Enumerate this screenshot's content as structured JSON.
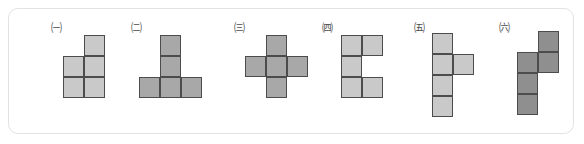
{
  "canvas": {
    "width": 584,
    "height": 144,
    "background": "#ffffff"
  },
  "panel": {
    "border_color": "#e2e2e2",
    "radius_px": 10,
    "name": "shape-options-panel"
  },
  "palette": {
    "light_gray": "#c9c9c9",
    "mid_gray": "#a8a8a8",
    "dark_gray": "#8f8f8f",
    "outline": "#4c4c4c",
    "label_text": "#4a4a4a"
  },
  "cell_size_px": 21,
  "figures": [
    {
      "id": "figure-1",
      "label": "㈠",
      "label_plain": "circled-giyeok",
      "shape_name": "p-pentomino",
      "fill": "#c9c9c9",
      "left": 32,
      "label_left": 8,
      "label_top": 13,
      "grid_left": 22,
      "grid_top": 26,
      "cols": 2,
      "rows": 3,
      "cells": [
        [
          1,
          0
        ],
        [
          0,
          1
        ],
        [
          1,
          1
        ],
        [
          0,
          2
        ],
        [
          1,
          2
        ]
      ]
    },
    {
      "id": "figure-2",
      "label": "㈡",
      "label_plain": "circled-nieun",
      "shape_name": "t-pentomino",
      "fill": "#a8a8a8",
      "left": 112,
      "label_left": 8,
      "label_top": 13,
      "grid_left": 18,
      "grid_top": 26,
      "cols": 3,
      "rows": 3,
      "cells": [
        [
          1,
          0
        ],
        [
          1,
          1
        ],
        [
          0,
          2
        ],
        [
          1,
          2
        ],
        [
          2,
          2
        ]
      ]
    },
    {
      "id": "figure-3",
      "label": "㈢",
      "label_plain": "circled-digeut",
      "shape_name": "plus-pentomino",
      "fill": "#a8a8a8",
      "left": 219,
      "label_left": 4,
      "label_top": 13,
      "grid_left": 17,
      "grid_top": 26,
      "cols": 3,
      "rows": 3,
      "cells": [
        [
          1,
          0
        ],
        [
          0,
          1
        ],
        [
          1,
          1
        ],
        [
          2,
          1
        ],
        [
          1,
          2
        ]
      ]
    },
    {
      "id": "figure-4",
      "label": "㈣",
      "label_plain": "circled-rieul",
      "shape_name": "c-pentomino",
      "fill": "#c9c9c9",
      "left": 307,
      "label_left": 4,
      "label_top": 13,
      "grid_left": 25,
      "grid_top": 26,
      "cols": 2,
      "rows": 3,
      "cells": [
        [
          0,
          0
        ],
        [
          1,
          0
        ],
        [
          0,
          1
        ],
        [
          0,
          2
        ],
        [
          1,
          2
        ]
      ]
    },
    {
      "id": "figure-5",
      "label": "㈤",
      "label_plain": "circled-mieum",
      "shape_name": "y-pentomino",
      "fill": "#c9c9c9",
      "left": 399,
      "label_left": 4,
      "label_top": 13,
      "grid_left": 24,
      "grid_top": 24,
      "cols": 2,
      "rows": 4,
      "cells": [
        [
          0,
          0
        ],
        [
          0,
          1
        ],
        [
          1,
          1
        ],
        [
          0,
          2
        ],
        [
          0,
          3
        ]
      ]
    },
    {
      "id": "figure-6",
      "label": "㈥",
      "label_plain": "circled-bieup",
      "shape_name": "n-pentomino",
      "fill": "#8f8f8f",
      "left": 484,
      "label_left": 4,
      "label_top": 13,
      "grid_left": 24,
      "grid_top": 22,
      "cols": 2,
      "rows": 4,
      "cells": [
        [
          1,
          0
        ],
        [
          0,
          1
        ],
        [
          1,
          1
        ],
        [
          0,
          2
        ],
        [
          0,
          3
        ]
      ]
    }
  ]
}
